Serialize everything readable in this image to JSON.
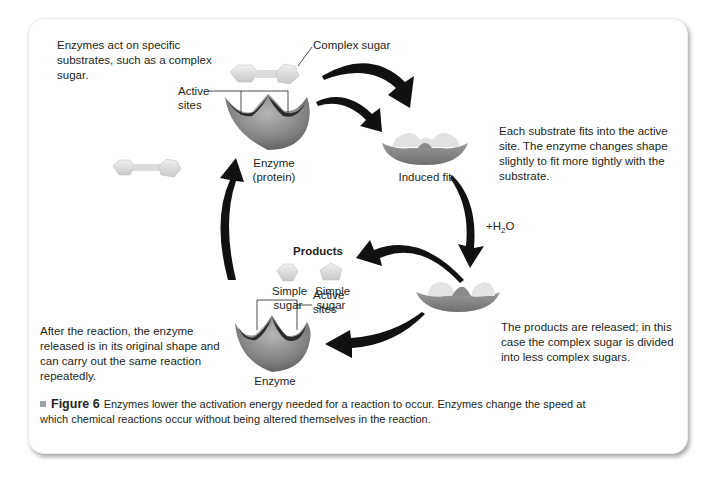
{
  "figure": {
    "number_label": "Figure 6",
    "caption": "Enzymes lower the activation energy needed for a reaction to occur. Enzymes change the speed at which chemical reactions occur without being altered themselves in the reaction."
  },
  "annotations": {
    "intro": "Enzymes act on specific substrates, such as a complex sugar.",
    "induced_fit_desc": "Each substrate fits into the active site. The enzyme changes shape slightly to fit more tightly with the substrate.",
    "release_desc": "The products are released; in this case the complex sugar is divided into less complex sugars.",
    "reuse_desc": "After the reaction, the enzyme released is in its original shape and can carry out the same reaction repeatedly."
  },
  "labels": {
    "complex_sugar": "Complex sugar",
    "active_sites_top_line1": "Active",
    "active_sites_top_line2": "sites",
    "enzyme_protein_line1": "Enzyme",
    "enzyme_protein_line2": "(protein)",
    "induced_fit": "Induced fit",
    "water_prefix": "+H",
    "water_sub": "2",
    "water_suffix": "O",
    "products": "Products",
    "simple_sugar_1_line1": "Simple",
    "simple_sugar_1_line2": "sugar",
    "simple_sugar_2_line1": "Simple",
    "simple_sugar_2_line2": "sugar",
    "active_sites_bottom_line1": "Active",
    "active_sites_bottom_line2": "sites",
    "enzyme_bottom": "Enzyme"
  },
  "colors": {
    "enzyme_gray": "#8c8c8c",
    "sugar_light": "#e3e3e3",
    "arrow_black": "#111111",
    "text": "#231f20",
    "bullet_gray": "#9aa3a7"
  }
}
